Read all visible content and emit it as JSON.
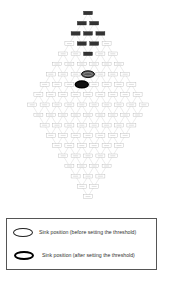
{
  "diagram": {
    "type": "diamond-lattice-network",
    "row_counts": [
      1,
      2,
      3,
      4,
      5,
      6,
      7,
      8,
      9,
      10,
      9,
      8,
      7,
      6,
      5,
      4,
      3,
      2,
      1
    ],
    "node_label": "node",
    "dark_nodes": [
      [
        0,
        0
      ],
      [
        1,
        0
      ],
      [
        1,
        1
      ],
      [
        2,
        0
      ],
      [
        2,
        1
      ],
      [
        2,
        2
      ],
      [
        3,
        1
      ],
      [
        3,
        2
      ],
      [
        4,
        2
      ]
    ],
    "sink_before": [
      6,
      3
    ],
    "sink_after": [
      7,
      3
    ],
    "colors": {
      "dark_node": "#333333",
      "light_node": "#ffffff",
      "edge": "#cccccc",
      "sink_border": "#000000"
    }
  },
  "legend": {
    "items": [
      {
        "style": "thin",
        "label": "Sink position (before setting the threshold)"
      },
      {
        "style": "thick",
        "label": "Sink position (after setting the threshold)"
      }
    ]
  }
}
